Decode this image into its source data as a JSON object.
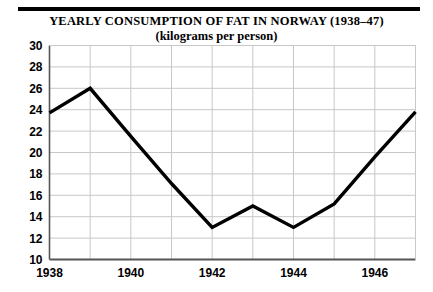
{
  "figure": {
    "title_line1": "YEARLY CONSUMPTION OF FAT IN NORWAY (1938–47)",
    "title_line2": "(kilograms per person)",
    "rule_color": "#000000",
    "line_color": "#000000",
    "grid_color": "#c8c8c8",
    "axis_color": "#555555",
    "background": "#ffffff"
  },
  "chart_data": {
    "type": "line",
    "title": "YEARLY CONSUMPTION OF FAT IN NORWAY (1938–47)",
    "subtitle": "(kilograms per person)",
    "xlabel": "",
    "ylabel": "",
    "x": [
      1938,
      1939,
      1940,
      1941,
      1942,
      1943,
      1944,
      1945,
      1946,
      1947
    ],
    "values": [
      23.7,
      26.0,
      21.5,
      17.1,
      13.0,
      15.0,
      13.0,
      15.2,
      19.6,
      23.8
    ],
    "series": [
      {
        "name": "Fat consumption",
        "values": [
          23.7,
          26.0,
          21.5,
          17.1,
          13.0,
          15.0,
          13.0,
          15.2,
          19.6,
          23.8
        ]
      }
    ],
    "xlim": [
      1938,
      1947
    ],
    "ylim": [
      10,
      30
    ],
    "yticks": [
      10,
      12,
      14,
      16,
      18,
      20,
      22,
      24,
      26,
      28,
      30
    ],
    "ytick_labels": [
      "10",
      "12",
      "14",
      "16",
      "18",
      "20",
      "22",
      "24",
      "26",
      "28",
      "30"
    ],
    "xticks": [
      1938,
      1940,
      1942,
      1944,
      1946
    ],
    "xtick_labels": [
      "1938",
      "1940",
      "1942",
      "1944",
      "1946"
    ],
    "xgrid_years": [
      1938,
      1939,
      1940,
      1941,
      1942,
      1943,
      1944,
      1945,
      1946,
      1947
    ],
    "grid": true,
    "legend": false,
    "legend_position": "none"
  }
}
